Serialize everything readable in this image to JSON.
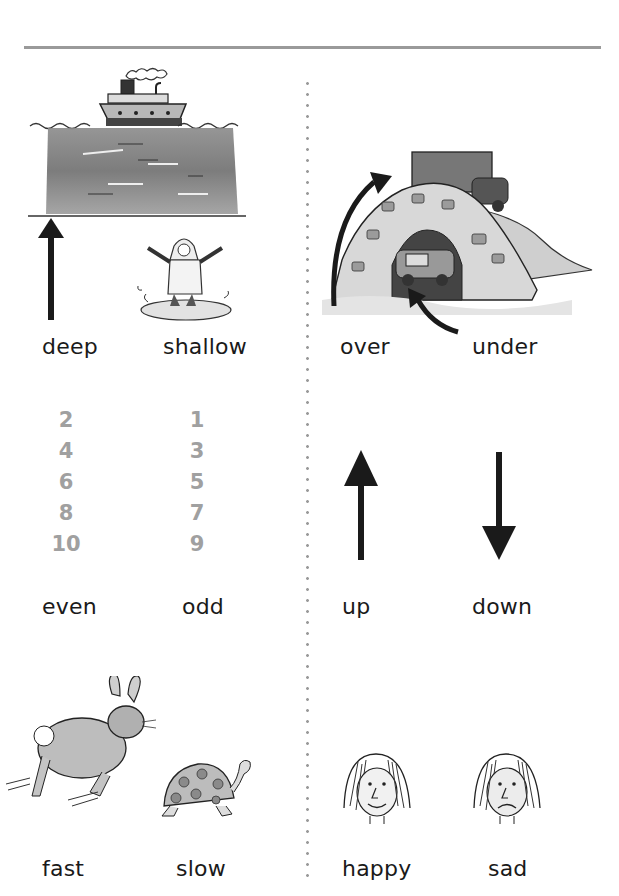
{
  "page": {
    "pairs": [
      {
        "left": "deep",
        "right": "shallow",
        "left_image": "ship-on-deep-water",
        "right_image": "child-in-puddle"
      },
      {
        "left": "over",
        "right": "under",
        "left_image": "arrow-over-bridge",
        "right_image": "car-under-bridge"
      },
      {
        "left": "even",
        "right": "odd"
      },
      {
        "left": "up",
        "right": "down",
        "left_image": "up-arrow",
        "right_image": "down-arrow"
      },
      {
        "left": "fast",
        "right": "slow",
        "left_image": "rabbit",
        "right_image": "tortoise"
      },
      {
        "left": "happy",
        "right": "sad",
        "left_image": "happy-face",
        "right_image": "sad-face"
      }
    ],
    "even_numbers": [
      "2",
      "4",
      "6",
      "8",
      "10"
    ],
    "odd_numbers": [
      "1",
      "3",
      "5",
      "7",
      "9"
    ]
  },
  "colors": {
    "text": "#1a1a1a",
    "numbers": "#a0a0a0",
    "rule": "#9a9a9a"
  }
}
